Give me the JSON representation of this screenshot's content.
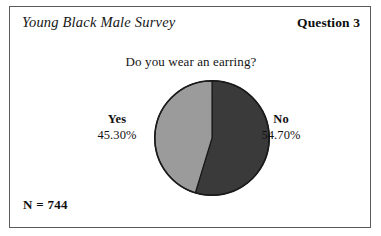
{
  "header": {
    "survey_title": "Young Black Male Survey",
    "question_number": "Question 3"
  },
  "footer": {
    "sample_size": "N = 744"
  },
  "chart_data": {
    "type": "pie",
    "title": "Do you wear an earring?",
    "subtitle": "",
    "xlabel": "",
    "ylabel": "",
    "legend_position": "none",
    "grid": false,
    "total_n": 744,
    "categories": [
      "No",
      "Yes"
    ],
    "values": [
      54.7,
      45.3
    ],
    "value_unit": "percent",
    "start_angle_deg": 0,
    "direction": "clockwise",
    "slices": [
      {
        "label": "No",
        "value": 54.7,
        "value_text": "54.70%",
        "color": "#3a3a3a",
        "label_side": "right"
      },
      {
        "label": "Yes",
        "value": 45.3,
        "value_text": "45.30%",
        "color": "#9b9b9b",
        "label_side": "left"
      }
    ],
    "annotations": [
      "N = 744"
    ]
  },
  "colors": {
    "frame": "#5a5a5a",
    "pie_outline": "#1a1a1a",
    "slice_dark": "#3a3a3a",
    "slice_light": "#9b9b9b",
    "text": "#111111",
    "background": "#ffffff"
  }
}
